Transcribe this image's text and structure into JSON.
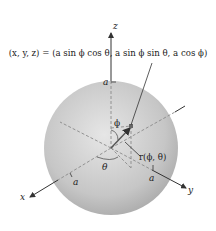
{
  "diagram": {
    "equation": "(x, y, z) = (a sin ϕ cos θ, a sin ϕ sin θ, a cos ϕ)",
    "axes": {
      "x": "x",
      "y": "y",
      "z": "z"
    },
    "labels": {
      "a_top": "a",
      "a_x": "a",
      "a_y": "a",
      "phi": "ϕ",
      "theta": "θ",
      "r_vector": "r(ϕ, θ)"
    },
    "colors": {
      "sphere_light": "#e4e4e4",
      "sphere_dark": "#a9a9a9",
      "axis": "#333333",
      "dashed": "#8a8a8a",
      "vector": "#555555"
    }
  }
}
